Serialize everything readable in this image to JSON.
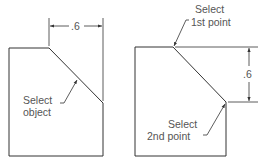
{
  "left_figure": {
    "dimension_value": ".6",
    "callout_line1": "Select",
    "callout_line2": "object"
  },
  "right_figure": {
    "dimension_value": ".6",
    "callout_top_line1": "Select",
    "callout_top_line2": "1st point",
    "callout_bottom_line1": "Select",
    "callout_bottom_line2": "2nd point"
  },
  "colors": {
    "line": "#333333",
    "text": "#555555"
  }
}
